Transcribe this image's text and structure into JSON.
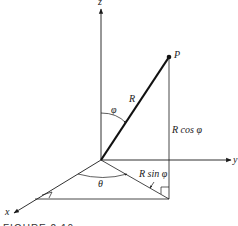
{
  "figure": {
    "caption": "FIGURE 2.10",
    "axes": {
      "x_label": "x",
      "y_label": "y",
      "z_label": "z"
    },
    "point_label": "P",
    "vector_label": "R",
    "angles": {
      "polar": "φ",
      "azimuth": "θ"
    },
    "components": {
      "vertical": "R cos φ",
      "horizontal": "R sin φ"
    },
    "colors": {
      "ink": "#1a1a1a",
      "background": "#ffffff"
    }
  }
}
